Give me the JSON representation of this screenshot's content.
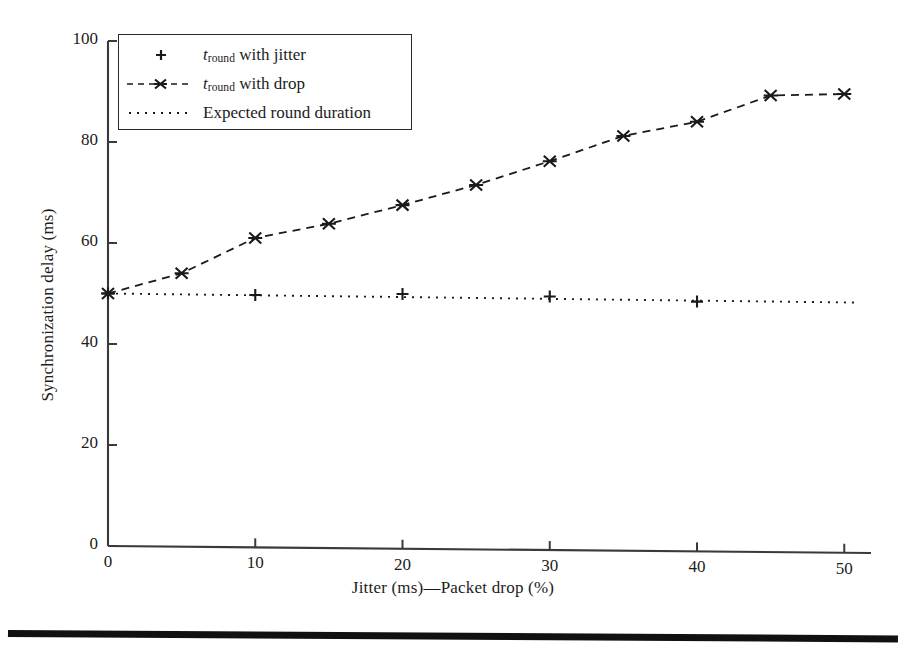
{
  "chart_data": {
    "type": "line",
    "title": "",
    "xlabel": "Jitter (ms)—Packet drop (%)",
    "ylabel": "Synchronization delay (ms)",
    "xlim": [
      0,
      51
    ],
    "ylim": [
      0,
      100
    ],
    "xticks": [
      0,
      10,
      20,
      30,
      40,
      50
    ],
    "xtick_labels": [
      "0",
      "10",
      "20",
      "30",
      "40",
      "50"
    ],
    "yticks": [
      0,
      20,
      40,
      60,
      80,
      100
    ],
    "ytick_labels": [
      "0",
      "20",
      "40",
      "60",
      "80",
      "100"
    ],
    "grid": false,
    "legend_position": "upper left",
    "series": [
      {
        "name": "t_round with jitter",
        "legend_label_prefix": "t",
        "legend_label_sub": "round",
        "legend_label_suffix": " with jitter",
        "marker": "plus",
        "linestyle": "none",
        "color": "#1a1a1a",
        "x": [
          0,
          10,
          20,
          30,
          40
        ],
        "y": [
          50,
          49.7,
          49.9,
          49.4,
          48.4
        ]
      },
      {
        "name": "t_round with drop",
        "legend_label_prefix": "t",
        "legend_label_sub": "round",
        "legend_label_suffix": " with drop",
        "marker": "x",
        "linestyle": "dashed",
        "color": "#1a1a1a",
        "x": [
          0,
          5,
          10,
          15,
          20,
          25,
          30,
          35,
          40,
          45,
          50
        ],
        "y": [
          50,
          54,
          61,
          63.8,
          67.5,
          71.5,
          76.2,
          81.2,
          84,
          89.2,
          89.5
        ]
      },
      {
        "name": "Expected round duration",
        "legend_label_prefix": "",
        "legend_label_sub": "",
        "legend_label_suffix": "Expected round duration",
        "marker": "none",
        "linestyle": "dotted",
        "color": "#1a1a1a",
        "x": [
          0,
          51
        ],
        "y": [
          50,
          48.2
        ]
      }
    ]
  },
  "legend": {
    "items": [
      {
        "sample": "plus-marker",
        "text_prefix": "t",
        "text_sub": "round",
        "text_suffix": " with jitter"
      },
      {
        "sample": "dashed-x-line",
        "text_prefix": "t",
        "text_sub": "round",
        "text_suffix": " with drop"
      },
      {
        "sample": "dotted-line",
        "text_prefix": "",
        "text_sub": "",
        "text_suffix": "Expected round duration"
      }
    ]
  },
  "axes": {
    "x_title": "Jitter (ms)—Packet drop (%)",
    "y_title": "Synchronization delay (ms)"
  },
  "colors": {
    "ink": "#1a1a1a",
    "axis": "#3a3a3a",
    "page": "#ffffff",
    "rule": "#111111"
  }
}
